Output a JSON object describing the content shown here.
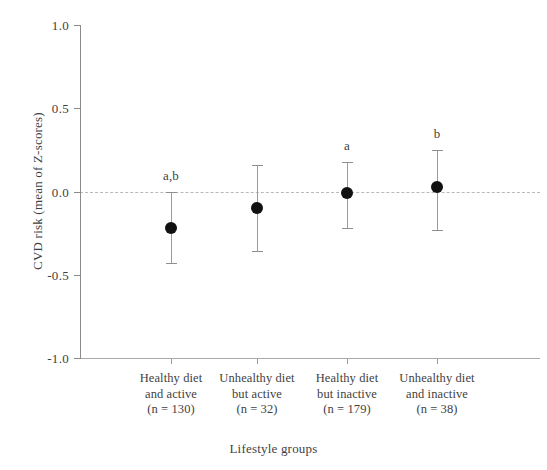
{
  "chart_data": {
    "type": "scatter",
    "title": "",
    "xlabel": "Lifestyle groups",
    "ylabel": "CVD risk (mean of Z-scores)",
    "ylim": [
      -1.0,
      1.0
    ],
    "yticks": [
      "1.0",
      "0.5",
      "0.0",
      "-0.5",
      "-1.0"
    ],
    "ytick_values": [
      1.0,
      0.5,
      0.0,
      -0.5,
      -1.0
    ],
    "grid": false,
    "legend": "none",
    "reference_line": {
      "value": 0.0,
      "style": "dashed"
    },
    "categories": [
      "Healthy diet and active",
      "Unhealthy diet but active",
      "Healthy diet but inactive",
      "Unhealthy diet and inactive"
    ],
    "points": [
      {
        "line1": "Healthy diet",
        "line2": "and active",
        "n_label": "(n = 130)",
        "n": 130,
        "mean": -0.22,
        "ci_low": -0.43,
        "ci_high": 0.0,
        "sig": "a,b"
      },
      {
        "line1": "Unhealthy diet",
        "line2": "but active",
        "n_label": "(n = 32)",
        "n": 32,
        "mean": -0.1,
        "ci_low": -0.36,
        "ci_high": 0.16,
        "sig": ""
      },
      {
        "line1": "Healthy diet",
        "line2": "but inactive",
        "n_label": "(n = 179)",
        "n": 179,
        "mean": -0.01,
        "ci_low": -0.22,
        "ci_high": 0.18,
        "sig": "a"
      },
      {
        "line1": "Unhealthy diet",
        "line2": "and inactive",
        "n_label": "(n = 38)",
        "n": 38,
        "mean": 0.03,
        "ci_low": -0.23,
        "ci_high": 0.25,
        "sig": "b"
      }
    ],
    "colors": {
      "marker": "#111111",
      "errorbar": "#9b9b9b",
      "axis": "#8a8a8a",
      "reference": "#b9b9b9",
      "text": "#3f3f3f",
      "background": "#ffffff"
    }
  }
}
